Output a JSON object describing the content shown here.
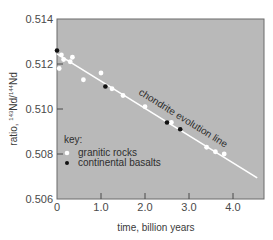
{
  "chart_data": {
    "type": "scatter",
    "title": "",
    "xlabel": "time, billion years",
    "ylabel": "ratio, 143Nd/144Nd",
    "ylabel_parts": {
      "prefix": "ratio, ",
      "sup1": "143",
      "mid": "Nd/",
      "sup2": "144",
      "suffix": "Nd"
    },
    "xlim": [
      0,
      4.7
    ],
    "ylim": [
      0.506,
      0.514
    ],
    "x_ticks": [
      0,
      1.0,
      2.0,
      3.0,
      4.0
    ],
    "x_tick_labels": [
      "0",
      "1.0",
      "2.0",
      "3.0",
      "4.0"
    ],
    "y_ticks": [
      0.506,
      0.508,
      0.51,
      0.512,
      0.514
    ],
    "y_tick_labels": [
      "0.506",
      "0.508",
      "0.510",
      "0.512",
      "0.514"
    ],
    "grid": false,
    "background": "#b9b9b9",
    "reference_line": {
      "label": "chondrite evolution line",
      "x": [
        0,
        4.55
      ],
      "y": [
        0.51245,
        0.50694
      ],
      "color": "#ffffff"
    },
    "series": [
      {
        "name": "granitic rocks",
        "marker": "white-circle",
        "color": "#ffffff",
        "points": [
          [
            0.05,
            0.5118
          ],
          [
            0.1,
            0.5124
          ],
          [
            0.15,
            0.5122
          ],
          [
            0.3,
            0.5121
          ],
          [
            0.35,
            0.5123
          ],
          [
            0.6,
            0.5113
          ],
          [
            1.0,
            0.5116
          ],
          [
            1.25,
            0.5109
          ],
          [
            1.5,
            0.5106
          ],
          [
            2.0,
            0.5101
          ],
          [
            2.6,
            0.5094
          ],
          [
            3.4,
            0.5083
          ],
          [
            3.6,
            0.5081
          ],
          [
            3.8,
            0.508
          ]
        ]
      },
      {
        "name": "continental basalts",
        "marker": "black-circle",
        "color": "#111111",
        "points": [
          [
            0.0,
            0.5126
          ],
          [
            1.1,
            0.511
          ],
          [
            2.5,
            0.5094
          ],
          [
            2.8,
            0.5091
          ]
        ]
      }
    ],
    "legend": {
      "title": "key:",
      "entries": [
        "granitic rocks",
        "continental basalts"
      ],
      "position": "lower-left inside"
    }
  }
}
